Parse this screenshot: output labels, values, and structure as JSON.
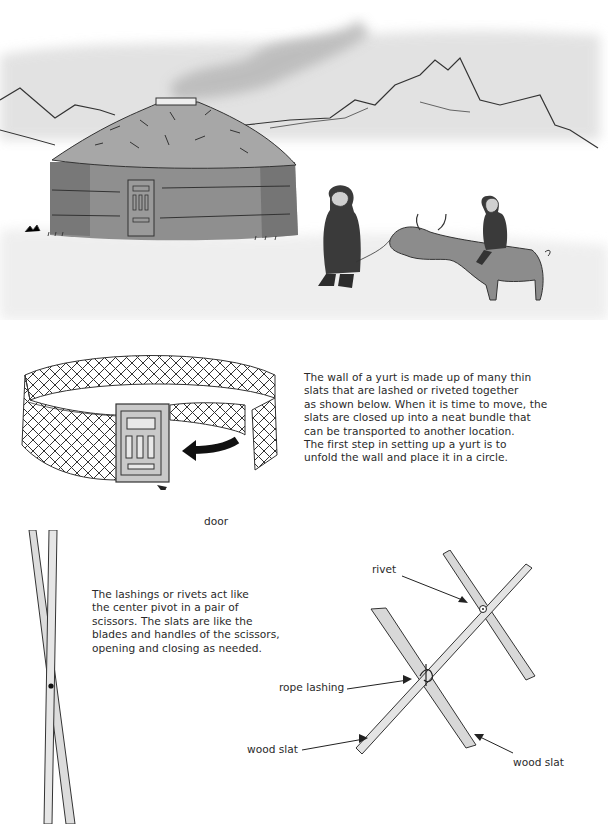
{
  "illustration": {
    "scene": "yurt-landscape",
    "description": "Watercolor scene: a yurt with smoke from the roof vent, mountains behind, a person leading a yak with a child riding on it"
  },
  "wall_section": {
    "paragraph_lines": [
      "The wall of a yurt is made up of many thin",
      "slats that are lashed or riveted together",
      "as shown below. When it is time to move, the",
      "slats are closed up into a neat bundle that",
      "can be transported to another location.",
      "The first step in setting up a yurt is to",
      "unfold the wall and place it in a circle."
    ],
    "door_label": "door"
  },
  "scissors_section": {
    "paragraph_lines": [
      "The lashings or rivets act like",
      "the center pivot in a pair of",
      "scissors. The slats are like the",
      "blades and handles of the scissors,",
      "opening and closing as needed."
    ]
  },
  "joint_diagram": {
    "labels": {
      "rivet": "rivet",
      "rope_lashing": "rope lashing",
      "wood_slat_left": "wood slat",
      "wood_slat_right": "wood slat"
    }
  }
}
